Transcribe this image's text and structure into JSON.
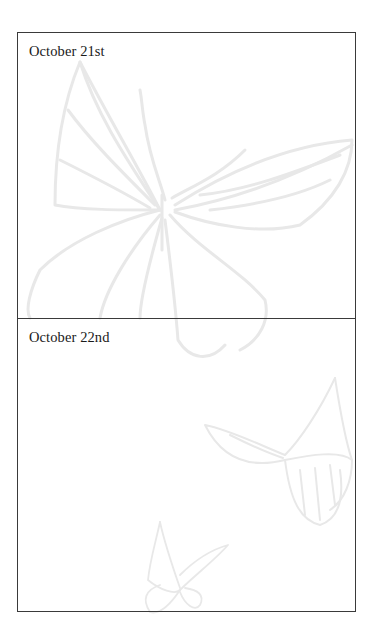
{
  "journal": {
    "entries": [
      {
        "date": "October 21st",
        "body": ""
      },
      {
        "date": "October 22nd",
        "body": ""
      }
    ]
  },
  "background": {
    "motif": "butterfly-watermark",
    "stroke_color": "#e6e6e6",
    "border_color": "#3a3a3a"
  }
}
